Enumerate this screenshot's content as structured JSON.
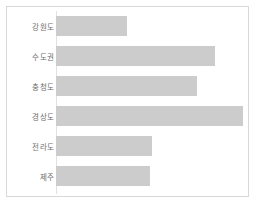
{
  "chart_data": {
    "type": "bar",
    "orientation": "horizontal",
    "title": "",
    "subtitle": "",
    "xlabel": "",
    "ylabel": "",
    "categories": [
      "강원도",
      "수도권",
      "충청도",
      "경상도",
      "전라도",
      "제주"
    ],
    "values": [
      38,
      85,
      75,
      100,
      51,
      50
    ],
    "xlim": [
      0,
      100
    ],
    "grid": false,
    "legend": null,
    "bar_color": "#cccccc",
    "tick_labels_x": [],
    "annotations": []
  },
  "figure": {
    "background_color": "#ffffff",
    "border_color": "#d8d8d8",
    "axis_color": "#e2e2e2",
    "label_color": "#6e6e6e"
  },
  "bars": [
    {
      "label": "강원도",
      "value": 38,
      "width_px": 71,
      "top_px": 4,
      "height_px": 30
    },
    {
      "label": "수도권",
      "value": 85,
      "width_px": 159,
      "top_px": 34,
      "height_px": 30
    },
    {
      "label": "충청도",
      "value": 75,
      "width_px": 141,
      "top_px": 64,
      "height_px": 30
    },
    {
      "label": "경상도",
      "value": 100,
      "width_px": 187,
      "top_px": 94,
      "height_px": 30
    },
    {
      "label": "전라도",
      "value": 51,
      "width_px": 96,
      "top_px": 124,
      "height_px": 30
    },
    {
      "label": "제주",
      "value": 50,
      "width_px": 94,
      "top_px": 154,
      "height_px": 30
    }
  ]
}
